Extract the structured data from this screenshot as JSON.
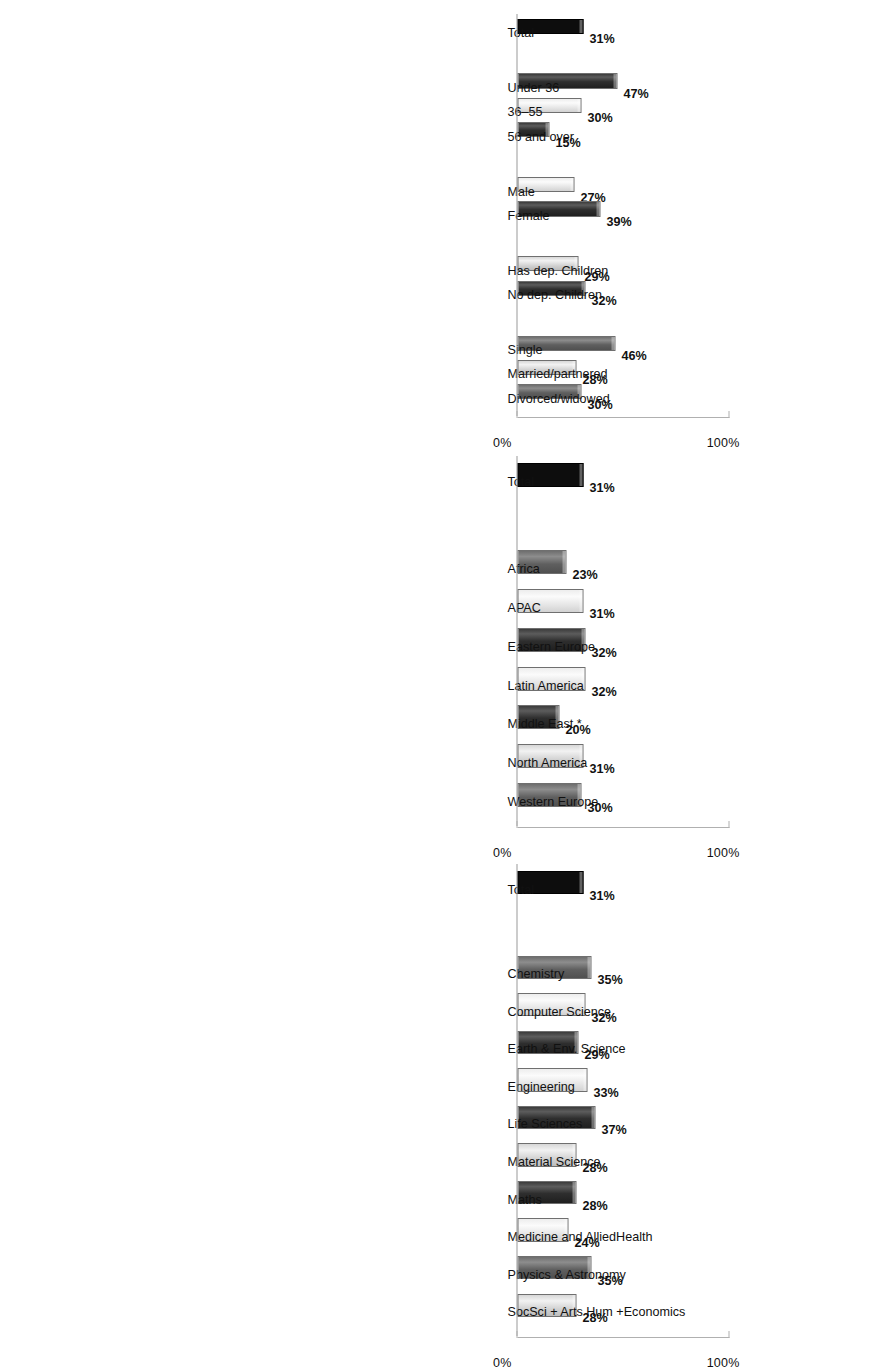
{
  "page": {
    "orientation": "rotated-90",
    "background": "#ffffff",
    "axis_color": "#b0b0b0",
    "text_color": "#111111"
  },
  "axis": {
    "min_label": "0%",
    "max_label": "100%",
    "min": 0,
    "max": 100
  },
  "charts": [
    {
      "id": "demographics",
      "groups": [
        {
          "bars": [
            {
              "label": "Total",
              "value": 31,
              "value_label": "31%",
              "fill": "b-black"
            }
          ]
        },
        {
          "bars": [
            {
              "label": "Under 36",
              "value": 47,
              "value_label": "47%",
              "fill": "b-dark"
            },
            {
              "label": "36–55",
              "value": 30,
              "value_label": "30%",
              "fill": "b-pale"
            },
            {
              "label": "56 and over",
              "value": 15,
              "value_label": "15%",
              "fill": "b-dark"
            }
          ]
        },
        {
          "bars": [
            {
              "label": "Male",
              "value": 27,
              "value_label": "27%",
              "fill": "b-pale"
            },
            {
              "label": "Female",
              "value": 39,
              "value_label": "39%",
              "fill": "b-dark"
            }
          ]
        },
        {
          "bars": [
            {
              "label": "Has dep. Children",
              "value": 29,
              "value_label": "29%",
              "fill": "b-light"
            },
            {
              "label": "No dep. Children",
              "value": 32,
              "value_label": "32%",
              "fill": "b-dark"
            }
          ]
        },
        {
          "bars": [
            {
              "label": "Single",
              "value": 46,
              "value_label": "46%",
              "fill": "b-mid"
            },
            {
              "label": "Married/partnered",
              "value": 28,
              "value_label": "28%",
              "fill": "b-light"
            },
            {
              "label": "Divorced/widowed",
              "value": 30,
              "value_label": "30%",
              "fill": "b-mid"
            }
          ]
        }
      ]
    },
    {
      "id": "regions",
      "groups": [
        {
          "bars": [
            {
              "label": "Total",
              "value": 31,
              "value_label": "31%",
              "fill": "b-black"
            }
          ]
        },
        {
          "bars": [
            {
              "label": "Africa",
              "value": 23,
              "value_label": "23%",
              "fill": "b-mid"
            },
            {
              "label": "APAC",
              "value": 31,
              "value_label": "31%",
              "fill": "b-pale"
            },
            {
              "label": "Eastern Europe",
              "value": 32,
              "value_label": "32%",
              "fill": "b-dark"
            },
            {
              "label": "Latin America",
              "value": 32,
              "value_label": "32%",
              "fill": "b-pale"
            },
            {
              "label": "Middle East *",
              "value": 20,
              "value_label": "20%",
              "fill": "b-dark"
            },
            {
              "label": "North America",
              "value": 31,
              "value_label": "31%",
              "fill": "b-light"
            },
            {
              "label": "Western Europe",
              "value": 30,
              "value_label": "30%",
              "fill": "b-mid"
            }
          ]
        }
      ]
    },
    {
      "id": "disciplines",
      "groups": [
        {
          "bars": [
            {
              "label": "Total",
              "value": 31,
              "value_label": "31%",
              "fill": "b-black"
            }
          ]
        },
        {
          "bars": [
            {
              "label": "Chemistry",
              "value": 35,
              "value_label": "35%",
              "fill": "b-mid"
            },
            {
              "label": "Computer Science",
              "value": 32,
              "value_label": "32%",
              "fill": "b-pale"
            },
            {
              "label": "Earth & Env. Science",
              "value": 29,
              "value_label": "29%",
              "fill": "b-dark"
            },
            {
              "label": "Engineering",
              "value": 33,
              "value_label": "33%",
              "fill": "b-pale"
            },
            {
              "label": "Life Sciences",
              "value": 37,
              "value_label": "37%",
              "fill": "b-dark"
            },
            {
              "label": "Material Science",
              "value": 28,
              "value_label": "28%",
              "fill": "b-light"
            },
            {
              "label": "Maths",
              "value": 28,
              "value_label": "28%",
              "fill": "b-dark"
            },
            {
              "label": "Medicine and Allied",
              "label2": "Health",
              "value": 24,
              "value_label": "24%",
              "fill": "b-pale"
            },
            {
              "label": "Physics & Astronomy",
              "value": 35,
              "value_label": "35%",
              "fill": "b-mid"
            },
            {
              "label": "SocSci + Arts Hum +",
              "label2": "Economics",
              "value": 28,
              "value_label": "28%",
              "fill": "b-light"
            }
          ]
        }
      ]
    }
  ],
  "chart_data": {
    "type": "bar",
    "title": "",
    "xlabel": "",
    "ylabel": "",
    "ylim": [
      0,
      100
    ],
    "ytick_labels": [
      "0%",
      "100%"
    ],
    "grid": false,
    "legend": null,
    "orientation": "vertical",
    "units": "percent",
    "panels": [
      {
        "name": "By demographics",
        "categories": [
          "Total",
          "Under 36",
          "36–55",
          "56 and over",
          "Male",
          "Female",
          "Has dep. Children",
          "No dep. Children",
          "Single",
          "Married/partnered",
          "Divorced/widowed"
        ],
        "values": [
          31,
          47,
          30,
          15,
          27,
          39,
          29,
          32,
          46,
          28,
          30
        ],
        "data_labels": [
          "31%",
          "47%",
          "30%",
          "15%",
          "27%",
          "39%",
          "29%",
          "32%",
          "46%",
          "28%",
          "30%"
        ]
      },
      {
        "name": "By region",
        "categories": [
          "Total",
          "Africa",
          "APAC",
          "Eastern Europe",
          "Latin America",
          "Middle East *",
          "North America",
          "Western Europe"
        ],
        "values": [
          31,
          23,
          31,
          32,
          32,
          20,
          31,
          30
        ],
        "data_labels": [
          "31%",
          "23%",
          "31%",
          "32%",
          "32%",
          "20%",
          "31%",
          "30%"
        ]
      },
      {
        "name": "By discipline",
        "categories": [
          "Total",
          "Chemistry",
          "Computer Science",
          "Earth & Env. Science",
          "Engineering",
          "Life Sciences",
          "Material Science",
          "Maths",
          "Medicine and Allied Health",
          "Physics & Astronomy",
          "SocSci + Arts Hum + Economics"
        ],
        "values": [
          31,
          35,
          32,
          29,
          33,
          37,
          28,
          28,
          24,
          35,
          28
        ],
        "data_labels": [
          "31%",
          "35%",
          "32%",
          "29%",
          "33%",
          "37%",
          "28%",
          "28%",
          "24%",
          "35%",
          "28%"
        ]
      }
    ]
  }
}
